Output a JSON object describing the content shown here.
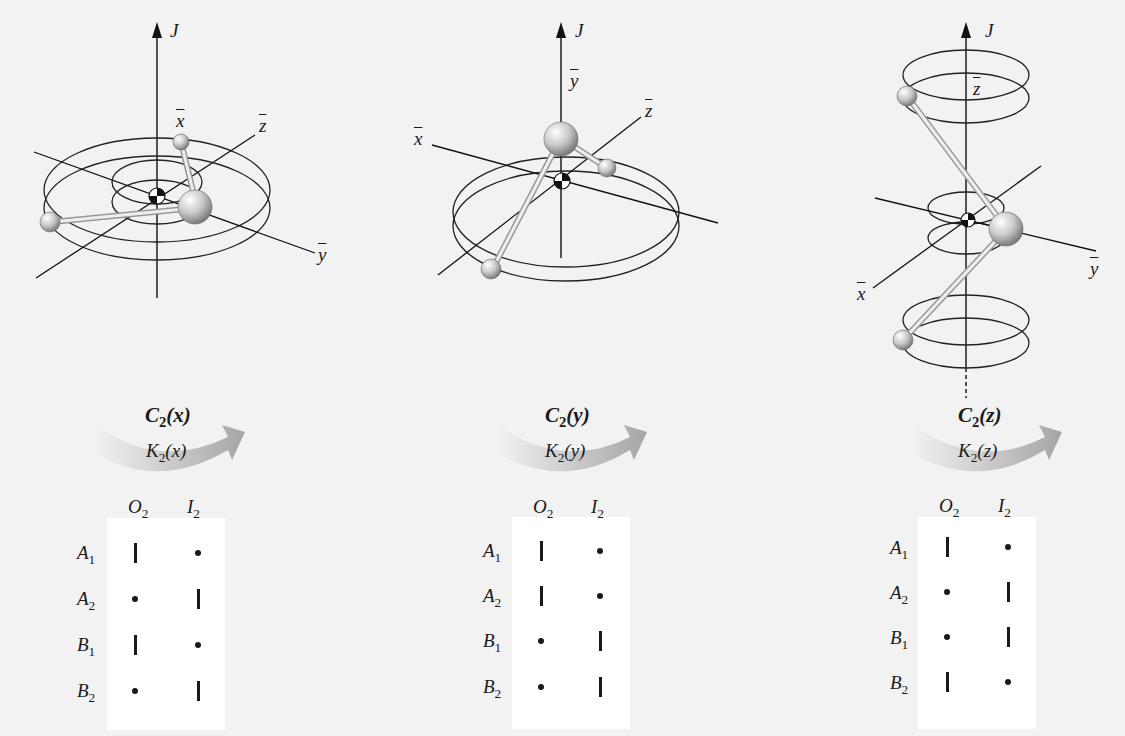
{
  "figure": {
    "panels": [
      {
        "id": "x",
        "axis_labels": {
          "J": "J",
          "x": "x",
          "y": "y",
          "z": "z"
        },
        "operation": {
          "symbol": "C",
          "sub": "2",
          "arg": "(x)"
        },
        "k_label": {
          "symbol": "K",
          "sub": "2",
          "arg": "(x)"
        },
        "columns": [
          {
            "symbol": "O",
            "sub": "2"
          },
          {
            "symbol": "I",
            "sub": "2"
          }
        ],
        "rows": [
          {
            "symbol": "A",
            "sub": "1",
            "marks": [
              "bar",
              "dot"
            ]
          },
          {
            "symbol": "A",
            "sub": "2",
            "marks": [
              "dot",
              "bar"
            ]
          },
          {
            "symbol": "B",
            "sub": "1",
            "marks": [
              "bar",
              "dot"
            ]
          },
          {
            "symbol": "B",
            "sub": "2",
            "marks": [
              "dot",
              "bar"
            ]
          }
        ]
      },
      {
        "id": "y",
        "axis_labels": {
          "J": "J",
          "x": "x",
          "y": "y",
          "z": "z"
        },
        "operation": {
          "symbol": "C",
          "sub": "2",
          "arg": "(y)"
        },
        "k_label": {
          "symbol": "K",
          "sub": "2",
          "arg": "(y)"
        },
        "columns": [
          {
            "symbol": "O",
            "sub": "2"
          },
          {
            "symbol": "I",
            "sub": "2"
          }
        ],
        "rows": [
          {
            "symbol": "A",
            "sub": "1",
            "marks": [
              "bar",
              "dot"
            ]
          },
          {
            "symbol": "A",
            "sub": "2",
            "marks": [
              "bar",
              "dot"
            ]
          },
          {
            "symbol": "B",
            "sub": "1",
            "marks": [
              "dot",
              "bar"
            ]
          },
          {
            "symbol": "B",
            "sub": "2",
            "marks": [
              "dot",
              "bar"
            ]
          }
        ]
      },
      {
        "id": "z",
        "axis_labels": {
          "J": "J",
          "x": "x",
          "y": "y",
          "z": "z"
        },
        "operation": {
          "symbol": "C",
          "sub": "2",
          "arg": "(z)"
        },
        "k_label": {
          "symbol": "K",
          "sub": "2",
          "arg": "(z)"
        },
        "columns": [
          {
            "symbol": "O",
            "sub": "2"
          },
          {
            "symbol": "I",
            "sub": "2"
          }
        ],
        "rows": [
          {
            "symbol": "A",
            "sub": "1",
            "marks": [
              "bar",
              "dot"
            ]
          },
          {
            "symbol": "A",
            "sub": "2",
            "marks": [
              "dot",
              "bar"
            ]
          },
          {
            "symbol": "B",
            "sub": "1",
            "marks": [
              "dot",
              "bar"
            ]
          },
          {
            "symbol": "B",
            "sub": "2",
            "marks": [
              "bar",
              "dot"
            ]
          }
        ]
      }
    ],
    "colors": {
      "background": "#f2f2f2",
      "table_background": "#ffffff",
      "ink": "#1a1a1a",
      "arrow_light": "#e6e6e6",
      "arrow_dark": "#a8a8a8",
      "atom_highlight": "#ffffff",
      "atom_shadow": "#8a8a8a"
    }
  }
}
